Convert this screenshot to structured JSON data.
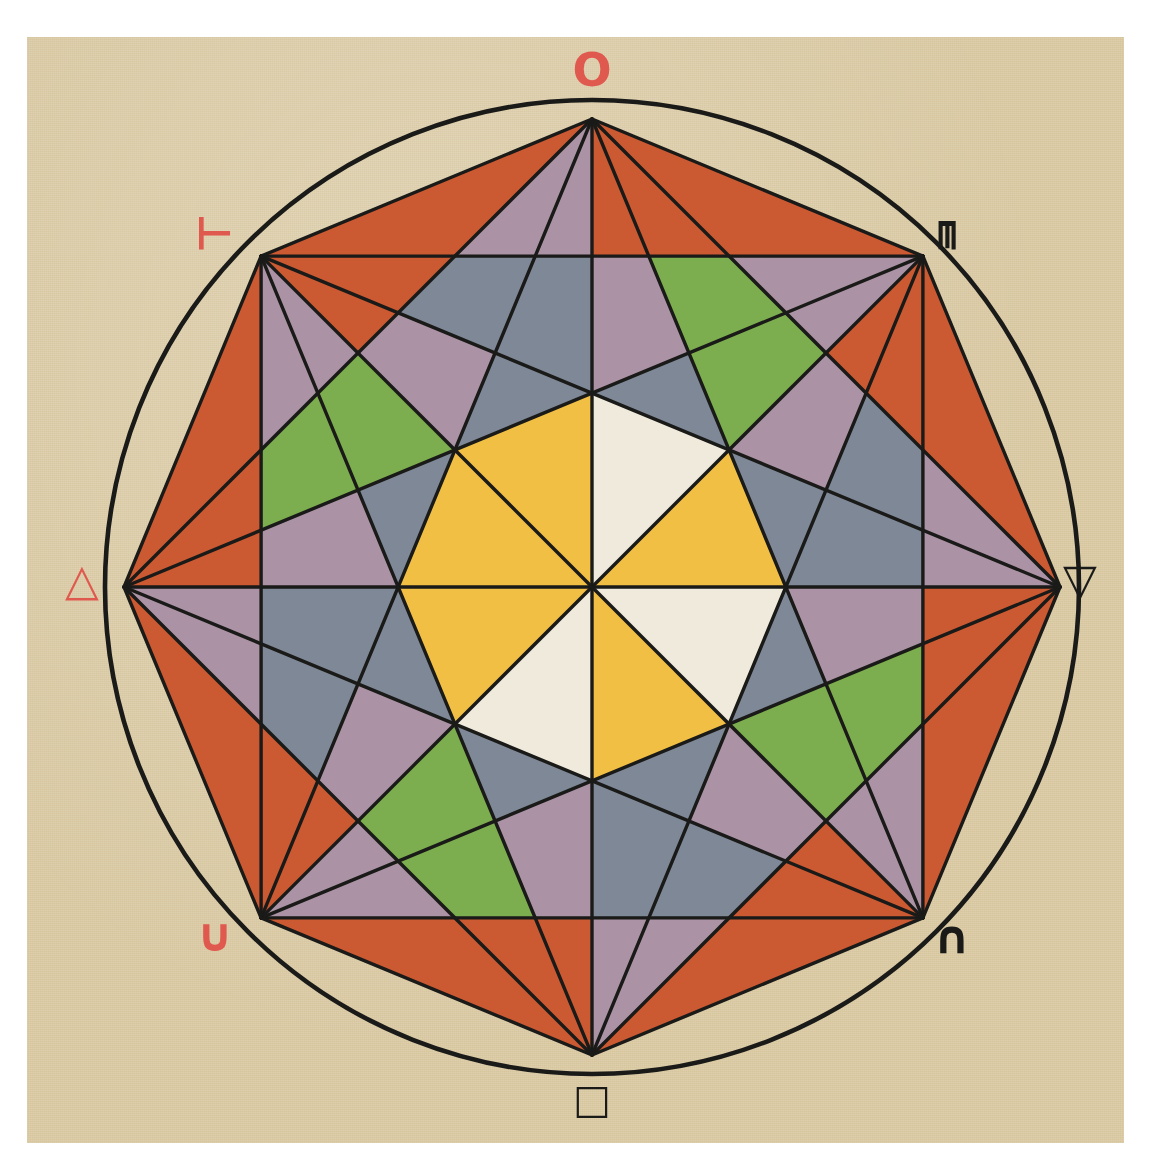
{
  "figure": {
    "paper_color": "#d9c9a3",
    "ink_color": "#1a1a18",
    "red_ink_color": "#e0594f"
  },
  "geometry": {
    "center_x": 592,
    "center_y": 587,
    "circle_radius": 487,
    "octagon_radius": 468,
    "vertex_count": 8,
    "chords": "complete graph on 8 vertices",
    "inner_polygon": "central octagon subdivided into 8 alternating triangles"
  },
  "palette": {
    "yellow": "#f2bf45",
    "orange_red": "#cb5a33",
    "slate": "#7e8896",
    "green": "#7cad4e",
    "mauve": "#ab93a5",
    "cream": "#efeadb",
    "outline": "#1a1a18"
  },
  "vertices": [
    {
      "id": "v-top",
      "symbol": "O",
      "symbol_name": "circle-symbol",
      "color": "red",
      "angle_deg": 270,
      "position": "top"
    },
    {
      "id": "v-top-right",
      "symbol": "ᄐ",
      "symbol_name": "inverted-k-symbol",
      "color": "black",
      "angle_deg": 315,
      "position": "top-right"
    },
    {
      "id": "v-right",
      "symbol": "▽",
      "symbol_name": "down-triangle-symbol",
      "color": "black",
      "angle_deg": 0,
      "position": "right"
    },
    {
      "id": "v-bottom-right",
      "symbol": "∩",
      "symbol_name": "intersection-symbol",
      "color": "black",
      "angle_deg": 45,
      "position": "bottom-right"
    },
    {
      "id": "v-bottom",
      "symbol": "□",
      "symbol_name": "square-symbol",
      "color": "black",
      "angle_deg": 90,
      "position": "bottom"
    },
    {
      "id": "v-bottom-left",
      "symbol": "∪",
      "symbol_name": "union-symbol",
      "color": "red",
      "angle_deg": 135,
      "position": "bottom-left"
    },
    {
      "id": "v-left",
      "symbol": "△",
      "symbol_name": "up-triangle-symbol",
      "color": "red",
      "angle_deg": 180,
      "position": "left"
    },
    {
      "id": "v-top-left",
      "symbol": "⊥",
      "symbol_name": "rotated-k-symbol",
      "color": "red",
      "angle_deg": 225,
      "position": "top-left"
    }
  ],
  "label_positions": [
    {
      "id": "v-top",
      "x": 592,
      "y": 70,
      "size": 46
    },
    {
      "id": "v-top-left",
      "x": 214,
      "y": 233,
      "size": 44
    },
    {
      "id": "v-top-right",
      "x": 958,
      "y": 235,
      "size": 44
    },
    {
      "id": "v-left",
      "x": 82,
      "y": 580,
      "size": 44
    },
    {
      "id": "v-right",
      "x": 1080,
      "y": 580,
      "size": 44
    },
    {
      "id": "v-bottom-left",
      "x": 215,
      "y": 935,
      "size": 46
    },
    {
      "id": "v-bottom-right",
      "x": 952,
      "y": 937,
      "size": 46
    },
    {
      "id": "v-bottom",
      "x": 592,
      "y": 1099,
      "size": 40
    }
  ]
}
